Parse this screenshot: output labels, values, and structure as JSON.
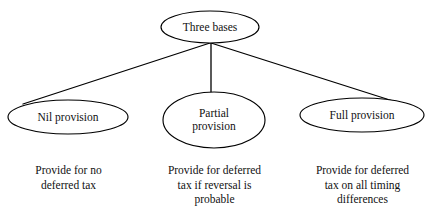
{
  "diagram": {
    "type": "tree-hierarchy",
    "background_color": "#ffffff",
    "line_color": "#000000",
    "text_color": "#111111",
    "root": {
      "id": "three-bases",
      "label": "Three bases",
      "shape": "ellipse",
      "cx": 210,
      "cy": 27,
      "rx": 49,
      "ry": 16
    },
    "branches": [
      {
        "id": "nil-provision",
        "label": "Nil provision",
        "shape": "ellipse",
        "cx": 68,
        "cy": 117,
        "rx": 60,
        "ry": 17,
        "caption": "Provide for no\ndeferred tax",
        "caption_lines": [
          "Provide for no",
          "deferred tax"
        ],
        "caption_x": 68,
        "caption_y": 165
      },
      {
        "id": "partial-provision",
        "label": "Partial\nprovision",
        "label_lines": [
          "Partial",
          "provision"
        ],
        "shape": "ellipse",
        "cx": 214,
        "cy": 120,
        "rx": 51,
        "ry": 28,
        "caption": "Provide for deferred\ntax if reversal is\nprobable",
        "caption_lines": [
          "Provide for deferred",
          "tax if reversal is",
          "probable"
        ],
        "caption_x": 214,
        "caption_y": 165
      },
      {
        "id": "full-provision",
        "label": "Full provision",
        "shape": "ellipse",
        "cx": 362,
        "cy": 115,
        "rx": 62,
        "ry": 17,
        "caption": "Provide for deferred\ntax on all timing\ndifferences",
        "caption_lines": [
          "Provide for deferred",
          "tax on all timing",
          "differences"
        ],
        "caption_x": 362,
        "caption_y": 165
      }
    ],
    "connectors": [
      {
        "id": "root-to-nil",
        "from": "three-bases",
        "to": "nil-provision",
        "x1": 210,
        "y1": 43,
        "x2": 23,
        "y2": 104
      },
      {
        "id": "root-to-partial",
        "from": "three-bases",
        "to": "partial-provision",
        "x1": 211,
        "y1": 43,
        "x2": 211,
        "y2": 93
      },
      {
        "id": "root-to-full",
        "from": "three-bases",
        "to": "full-provision",
        "x1": 211,
        "y1": 43,
        "x2": 393,
        "y2": 101
      }
    ]
  }
}
